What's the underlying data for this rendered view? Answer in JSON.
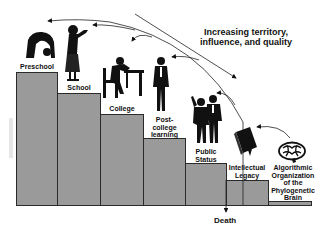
{
  "diagram": {
    "title": "Increasing territory,\ninfluence, and quality",
    "end_label": "Death",
    "colors": {
      "step_fill": "#9a9a9a",
      "step_border": "#2a2a2a",
      "ink": "#111111",
      "background": "#ffffff"
    },
    "steps": [
      {
        "label": "Preschool",
        "figure": "child-bending-icon"
      },
      {
        "label": "School",
        "figure": "girl-icon"
      },
      {
        "label": "College",
        "figure": "student-at-desk-icon"
      },
      {
        "label": "Post-\ncollege\nlearning",
        "figure": "standing-man-icon"
      },
      {
        "label": "Public\nStatus",
        "figure": "couple-icon"
      },
      {
        "label": "Intellectual\nLegacy",
        "figure": "book-icon"
      },
      {
        "label": "Algorithmic\nOrganization\nof the\nPhylogenetic\nBrain",
        "figure": "brain-icon"
      }
    ]
  }
}
